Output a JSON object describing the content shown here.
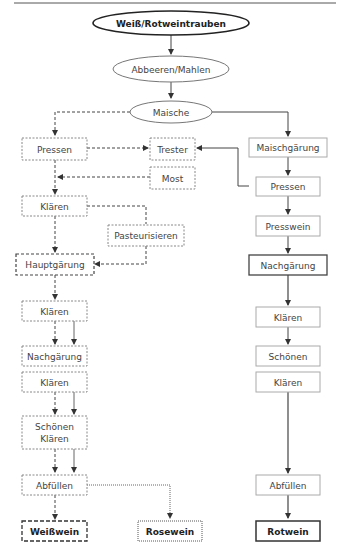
{
  "title": "Weiß/Rotweintrauben",
  "nodes": {
    "start": "Weiß/Rotweintrauben",
    "abbeeren": "Abbeeren/Mahlen",
    "maische": "Maische",
    "white": {
      "pressen": "Pressen",
      "trester": "Trester",
      "most": "Most",
      "klaeren1": "Klären",
      "pasteurisieren": "Pasteurisieren",
      "hauptgaerung": "Hauptgärung",
      "klaeren2": "Klären",
      "nachgaerung": "Nachgärung",
      "klaeren3": "Klären",
      "schoenen_line1": "Schönen",
      "schoenen_line2": "Klären",
      "abfuellen": "Abfüllen",
      "weisswein": "Weißwein"
    },
    "rose": {
      "rosewein": "Rosewein"
    },
    "red": {
      "maischgaerung": "Maischgärung",
      "pressen": "Pressen",
      "presswein": "Presswein",
      "nachgaerung": "Nachgärung",
      "klaeren1": "Klären",
      "schoenen": "Schönen",
      "klaeren2": "Klären",
      "abfuellen": "Abfüllen",
      "rotwein": "Rotwein"
    }
  },
  "colors": {
    "line": "#555555",
    "box_border": "#999999",
    "bold_border": "#444444",
    "text": "#444444"
  }
}
